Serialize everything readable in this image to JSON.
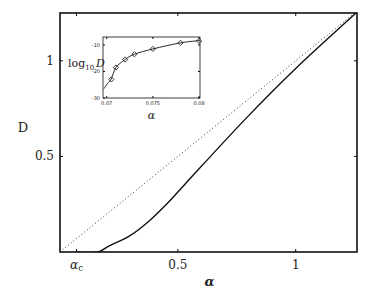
{
  "chart_data": [
    {
      "id": "main",
      "type": "line",
      "title": "",
      "xlabel": "α",
      "ylabel": "D",
      "xlim": [
        0,
        1.26
      ],
      "ylim": [
        0,
        1.25
      ],
      "grid": false,
      "legend": null,
      "x_ticks": [
        {
          "value": 0.07,
          "label": "α_c"
        },
        {
          "value": 0.5,
          "label": "0.5"
        },
        {
          "value": 1.0,
          "label": "1"
        }
      ],
      "y_ticks": [
        {
          "value": 0.5,
          "label": "0.5"
        },
        {
          "value": 1.0,
          "label": "1"
        }
      ],
      "series": [
        {
          "name": "D(α)",
          "style": "solid",
          "color": "#111111",
          "x": [
            0.07,
            0.16,
            0.205,
            0.29,
            0.376,
            0.46,
            0.534,
            0.786,
            1.0,
            1.26
          ],
          "y": [
            0.0,
            0.0,
            0.03,
            0.08,
            0.16,
            0.26,
            0.36,
            0.695,
            0.96,
            1.255
          ]
        },
        {
          "name": "D = α",
          "style": "dotted",
          "color": "#333333",
          "x": [
            0.0,
            1.26
          ],
          "y": [
            0.0,
            1.26
          ]
        }
      ]
    },
    {
      "id": "inset",
      "type": "line",
      "title": "",
      "xlabel": "α",
      "ylabel": "log₁₀ D",
      "xlim": [
        0.0696,
        0.0801
      ],
      "ylim": [
        -30,
        -7
      ],
      "grid": false,
      "x_ticks": [
        {
          "value": 0.07,
          "label": "0.07"
        },
        {
          "value": 0.075,
          "label": "0.075"
        },
        {
          "value": 0.08,
          "label": "0.08"
        }
      ],
      "y_ticks": [
        {
          "value": -10,
          "label": "-10"
        },
        {
          "value": -20,
          "label": "-20"
        },
        {
          "value": -30,
          "label": "-30"
        }
      ],
      "series": [
        {
          "name": "fit",
          "style": "solid",
          "color": "#111111",
          "x": [
            0.0697,
            0.0701,
            0.0705,
            0.071,
            0.072,
            0.073,
            0.075,
            0.078,
            0.0802
          ],
          "y": [
            -26.5,
            -24.5,
            -22.8,
            -18.5,
            -15.5,
            -13.5,
            -11.5,
            -9.2,
            -8.3
          ]
        },
        {
          "name": "data",
          "style": "markers",
          "marker": "diamond",
          "color": "#111111",
          "x": [
            0.0705,
            0.071,
            0.072,
            0.073,
            0.075,
            0.078,
            0.08
          ],
          "y": [
            -23,
            -18.5,
            -15.5,
            -13.5,
            -11.5,
            -9.2,
            -8.5
          ]
        }
      ]
    }
  ]
}
